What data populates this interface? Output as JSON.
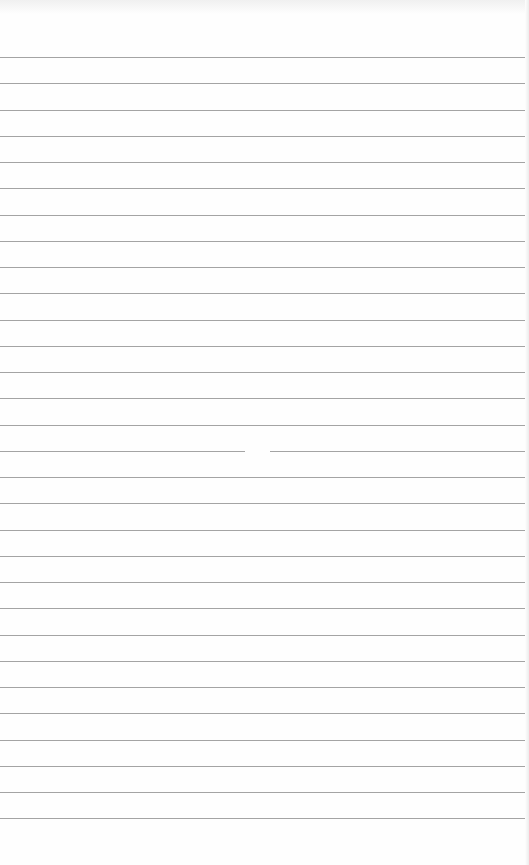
{
  "page": {
    "type": "lined-paper",
    "background": "#fefefe",
    "rule_color": "#a4a4a4",
    "rule_count": 30,
    "first_rule_y": 57,
    "rule_spacing": 26.25
  }
}
